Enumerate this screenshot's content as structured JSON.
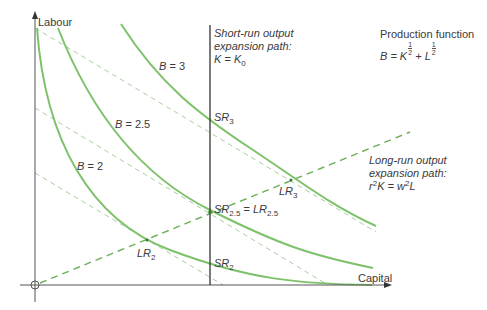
{
  "axes": {
    "y_label": "Labour",
    "x_label": "Capital"
  },
  "curves": [
    {
      "label": "B = 3",
      "var": "B",
      "value": "3"
    },
    {
      "label": "B = 2.5",
      "var": "B",
      "value": "2.5"
    },
    {
      "label": "B = 2",
      "var": "B",
      "value": "2"
    }
  ],
  "short_run": {
    "line1": "Short-run output",
    "line2": "expansion path:",
    "eq_lhs": "K",
    "eq_eq": " = ",
    "eq_rhs": "K",
    "eq_sub": "0"
  },
  "long_run": {
    "line1": "Long-run output",
    "line2": "expansion path:",
    "eq_r": "r",
    "eq_r_sup": "2",
    "eq_k": "K = w",
    "eq_w_sup": "2",
    "eq_l": "L"
  },
  "production_function": {
    "title": "Production function",
    "eq_b": "B = K",
    "eq_plus": " + L",
    "exp_num": "1",
    "exp_den": "2"
  },
  "points": {
    "sr3": {
      "base": "SR",
      "sub": "3"
    },
    "sr25": {
      "base": "SR",
      "sub": "2.5",
      "eq": " = ",
      "base2": "LR",
      "sub2": "2.5"
    },
    "sr2": {
      "base": "SR",
      "sub": "2"
    },
    "lr3": {
      "base": "LR",
      "sub": "3"
    },
    "lr2": {
      "base": "LR",
      "sub": "2"
    }
  },
  "colors": {
    "curve": "#7dc26b",
    "dashed_long_run": "#6aae58",
    "isocost": "#a8cf9c",
    "axis": "#555555",
    "vertical": "#222222"
  }
}
